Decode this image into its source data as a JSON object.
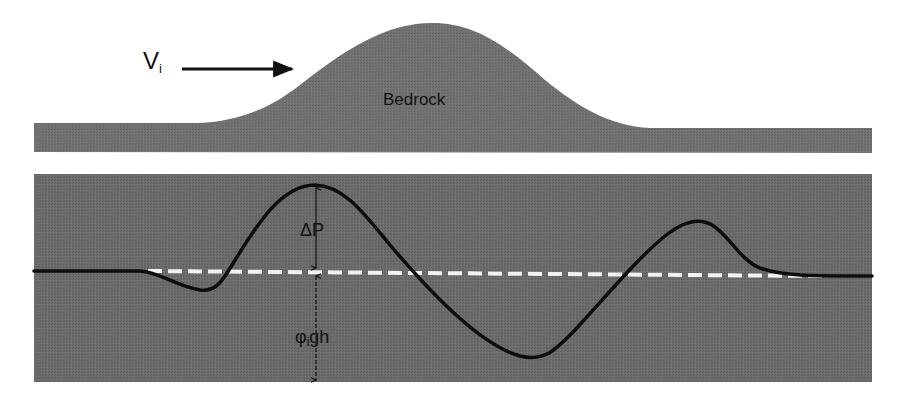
{
  "figure": {
    "colors": {
      "background": "#ffffff",
      "panel_fill": "#6b6b6b",
      "bedrock_fill": "#707070",
      "curve": "#0d0d0d",
      "reference_line": "#f2f2f2",
      "text": "#111111"
    },
    "top_panel": {
      "velocity_label": "V",
      "velocity_subscript": "i",
      "arrow_direction": "right",
      "bedrock_label": "Bedrock"
    },
    "bottom_panel": {
      "delta_p_label": "ΔP",
      "hydrostatic_label_symbol": "φ",
      "hydrostatic_label_subscript": "i",
      "hydrostatic_label_suffix": "gh",
      "reference_line_style": "dashed",
      "curve_description": "pressure profile: small dip upstream, large peak over stoss side, deep trough over lee side, secondary peak downstream, returning to baseline"
    }
  }
}
